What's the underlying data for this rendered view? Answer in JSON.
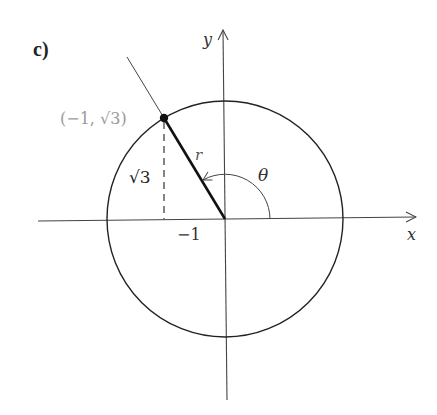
{
  "figure": {
    "part_label": "c)",
    "axes": {
      "x_label": "x",
      "y_label": "y"
    },
    "point_label": "(−1, √3)",
    "radius_label": "r",
    "angle_label": "θ",
    "height_label": "√3",
    "tick_label": "−1"
  },
  "colors": {
    "stroke": "#222222",
    "axis": "#444444",
    "point_label": "#9a9a9a",
    "background": "#ffffff"
  },
  "geometry": {
    "origin": [
      225,
      219
    ],
    "circle_radius_px": 118,
    "point": {
      "x": -1,
      "y": "√3"
    },
    "angle_degrees": 120
  }
}
